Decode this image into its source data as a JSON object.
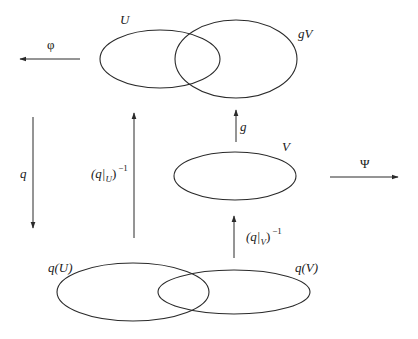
{
  "diagram": {
    "sets": [
      {
        "id": "U",
        "label": "U",
        "cx": 160,
        "cy": 59,
        "rx": 60,
        "ry": 29,
        "label_x": 120,
        "label_y": 24
      },
      {
        "id": "gV",
        "label": "gV",
        "cx": 236,
        "cy": 59,
        "rx": 61,
        "ry": 39,
        "label_x": 298,
        "label_y": 38
      },
      {
        "id": "V",
        "label": "V",
        "cx": 235,
        "cy": 176,
        "rx": 61,
        "ry": 24,
        "label_x": 282,
        "label_y": 151
      },
      {
        "id": "qU",
        "label": "q(U)",
        "cx": 133,
        "cy": 292,
        "rx": 76,
        "ry": 29,
        "label_x": 48,
        "label_y": 272
      },
      {
        "id": "qV",
        "label": "q(V)",
        "cx": 234,
        "cy": 292,
        "rx": 76,
        "ry": 22,
        "label_x": 295,
        "label_y": 272
      }
    ],
    "arrows": [
      {
        "id": "phi",
        "label": "φ",
        "direction": "left",
        "x1": 80,
        "y1": 59,
        "x2": 20,
        "y2": 59,
        "label_x": 47,
        "label_y": 49
      },
      {
        "id": "q",
        "label": "q",
        "direction": "down",
        "x1": 33,
        "y1": 117,
        "x2": 33,
        "y2": 228,
        "label_x": 20,
        "label_y": 178
      },
      {
        "id": "q_restrict_U_inv",
        "label_main": "(q|",
        "label_sub": "U",
        "label_close": ")",
        "label_sup": "−1",
        "direction": "up",
        "x1": 134,
        "y1": 238,
        "x2": 134,
        "y2": 113,
        "label_x": 91,
        "label_y": 178
      },
      {
        "id": "g",
        "label": "g",
        "direction": "up",
        "x1": 236,
        "y1": 142,
        "x2": 236,
        "y2": 110,
        "label_x": 240,
        "label_y": 131
      },
      {
        "id": "q_restrict_V_inv",
        "label_main": "(q|",
        "label_sub": "V",
        "label_close": ")",
        "label_sup": "−1",
        "direction": "up",
        "x1": 234,
        "y1": 258,
        "x2": 234,
        "y2": 216,
        "label_x": 246,
        "label_y": 241
      },
      {
        "id": "psi",
        "label": "Ψ",
        "direction": "right",
        "x1": 330,
        "y1": 177,
        "x2": 398,
        "y2": 177,
        "label_x": 360,
        "label_y": 168
      }
    ]
  }
}
